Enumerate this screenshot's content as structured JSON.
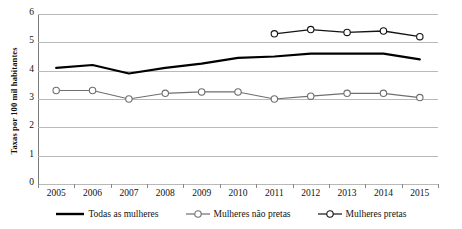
{
  "chart_data": {
    "type": "line",
    "title": "",
    "xlabel": "",
    "ylabel": "Taxas por 100 mil habitantes",
    "categories": [
      "2005",
      "2006",
      "2007",
      "2008",
      "2009",
      "2010",
      "2011",
      "2012",
      "2013",
      "2014",
      "2015"
    ],
    "ylim": [
      0,
      6
    ],
    "yticks": [
      0,
      1,
      2,
      3,
      4,
      5,
      6
    ],
    "grid": true,
    "legend_position": "bottom",
    "series": [
      {
        "name": "Todas as mulheres",
        "color": "#000000",
        "marker": "none",
        "line_width": 2.2,
        "values": [
          4.1,
          4.2,
          3.9,
          4.1,
          4.25,
          4.45,
          4.5,
          4.6,
          4.6,
          4.6,
          4.4
        ]
      },
      {
        "name": "Mulheres não pretas",
        "color": "#6f6f6f",
        "marker": "circle",
        "line_width": 1.1,
        "values": [
          3.3,
          3.3,
          3.0,
          3.2,
          3.25,
          3.25,
          3.0,
          3.1,
          3.2,
          3.2,
          3.05
        ]
      },
      {
        "name": "Mulheres pretas",
        "color": "#141414",
        "marker": "circle",
        "line_width": 1.3,
        "values": [
          null,
          null,
          null,
          null,
          null,
          null,
          5.3,
          5.45,
          5.35,
          5.4,
          5.2
        ]
      }
    ]
  },
  "axis": {
    "y_title": "Taxas por 100 mil habitantes",
    "y_tick_labels": [
      "6",
      "5",
      "4",
      "3",
      "2",
      "1",
      "0"
    ],
    "x_tick_labels": [
      "2005",
      "2006",
      "2007",
      "2008",
      "2009",
      "2010",
      "2011",
      "2012",
      "2013",
      "2014",
      "2015"
    ]
  },
  "legend": {
    "items": [
      {
        "label": "Todas as mulheres",
        "style": "solid-thick",
        "color": "#000000"
      },
      {
        "label": "Mulheres não pretas",
        "style": "line-marker",
        "color": "#6f6f6f"
      },
      {
        "label": "Mulheres pretas",
        "style": "line-marker",
        "color": "#141414"
      }
    ]
  }
}
